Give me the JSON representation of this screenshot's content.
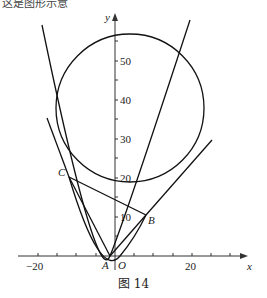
{
  "header": {
    "cutoff_text": "这是图形示意"
  },
  "figure": {
    "caption": "图 14",
    "axes": {
      "x_label": "x",
      "y_label": "y",
      "origin_label": "O",
      "x_ticks": [
        "−20",
        "20"
      ],
      "y_ticks": [
        "10",
        "20",
        "30",
        "40",
        "50"
      ]
    },
    "points": {
      "A": {
        "label": "A",
        "x": -1.5,
        "y": 0
      },
      "B": {
        "label": "B",
        "x": 8,
        "y": 10.5
      },
      "C": {
        "label": "C",
        "x": -12,
        "y": 20
      }
    },
    "circle": {
      "cx": 4,
      "cy": 38,
      "r": 19
    }
  }
}
